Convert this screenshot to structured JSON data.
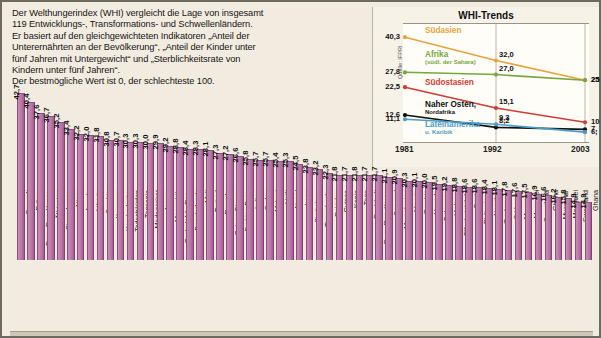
{
  "intro": {
    "line1": "Der Welthungerindex (WHI) vergleicht die Lage von insgesamt",
    "line2": "119 Entwicklungs-, Transformations- und Schwellenländern.",
    "line3": "Er basiert auf den gleichgewichteten Indikatoren „Anteil der",
    "line4": "Unterernährten an der Bevölkerung“, „Anteil der Kinder unter",
    "line5": "fünf Jahren mit Untergewicht“ und „Sterblichkeitsrate von",
    "line6": "Kindern unter fünf Jahren“.",
    "line7": "Der bestmögliche Wert ist 0, der schlechteste 100."
  },
  "trends": {
    "title": "WHI-Trends",
    "source": "Quelle: IFPRI",
    "x_ticks": [
      "1981",
      "1992",
      "2003"
    ],
    "series_labels": [
      {
        "name": "Südasien",
        "color": "#e8a33d",
        "sub": ""
      },
      {
        "name": "Afrika",
        "color": "#76a63f",
        "sub": "(südl. der Sahara)"
      },
      {
        "name": "Südostasien",
        "color": "#cf3b35",
        "sub": ""
      },
      {
        "name": "Naher Osten,",
        "color": "#111111",
        "sub": "Nordafrika"
      },
      {
        "name": "Lateinamerika",
        "color": "#4a9ec6",
        "sub": "u. Karibik"
      }
    ]
  },
  "chart_data": [
    {
      "type": "bar",
      "title": "Welthungerindex 2007 nach Ländern",
      "xlabel": "",
      "ylabel": "WHI-Wert",
      "ylim": [
        0,
        45
      ],
      "categories": [
        "Burundi",
        "Eritrea",
        "Dem. Rep. Kongo",
        "Äthiopien",
        "Sierra Leone",
        "Niger",
        "Angola",
        "Liberia",
        "Sambia",
        "Komoren",
        "Kambodscha",
        "Tadschikistan",
        "Tansania",
        "Madagaskar",
        "Jemen",
        "Mosambik",
        "Zentralafrik. Rep.",
        "Bangladesch",
        "Mali",
        "Tschad",
        "Ruanda",
        "Guinea-Bissau",
        "Burkina Faso",
        "Indien",
        "Sudan",
        "Malawi",
        "Haiti",
        "Nepal",
        "Laos",
        "Simbabwe",
        "Timor-Leste",
        "Pakistan",
        "Guinea",
        "Kenia",
        "Togo",
        "Dschibuti",
        "Dem. Rep. Korea",
        "Senegal",
        "Mauretanien",
        "Nigeria",
        "Gambia",
        "Uganda",
        "Botswana",
        "Vietnam",
        "Elfenbeinküste",
        "Benin",
        "Philippinen",
        "Namibia",
        "Guatemala",
        "Sri Lanka",
        "Myanmar",
        "Mongolei",
        "Swasiland",
        "Ghana"
      ],
      "values": [
        42.7,
        40.4,
        37.6,
        36.7,
        35.2,
        33.4,
        32.2,
        32.0,
        31.8,
        30.8,
        30.7,
        30.3,
        30.3,
        30.0,
        29.9,
        29.2,
        28.8,
        28.4,
        28.3,
        28.1,
        27.3,
        27.2,
        26.6,
        25.8,
        25.7,
        25.7,
        25.4,
        25.3,
        24.5,
        23.8,
        23.2,
        22.3,
        21.8,
        21.7,
        21.8,
        21.7,
        21.7,
        21.1,
        20.9,
        20.3,
        20.1,
        20.0,
        19.5,
        19.2,
        18.8,
        18.6,
        18.6,
        18.4,
        18.1,
        17.8,
        17.6,
        17.5,
        16.9,
        16.6
      ],
      "value_labels": [
        "42,7",
        "40,4",
        "37,6",
        "36,7",
        "35,2",
        "33,4",
        "32,2",
        "32,0",
        "31,8",
        "30,8",
        "30,7",
        "30,3",
        "30,3",
        "30,0",
        "29,9",
        "29,2",
        "28,8",
        "28,4",
        "28,3",
        "28,1",
        "27,3",
        "27,2",
        "26,6",
        "25,8",
        "25,7",
        "25,7",
        "25,4",
        "25,3",
        "24,5",
        "23,8",
        "23,2",
        "22,3",
        "21,8",
        "21,7",
        "21,8",
        "21,7",
        "21,7",
        "21,1",
        "20,9",
        "20,3",
        "20,1",
        "20,0",
        "19,5",
        "19,2",
        "18,8",
        "18,6",
        "18,6",
        "18,4",
        "18,1",
        "17,8",
        "17,6",
        "17,5",
        "16,9",
        "16,6"
      ],
      "extra_categories": [
        "Guatemala",
        "Sri Lanka",
        "Myanmar",
        "Mongolei",
        "Swasiland",
        "Ghana"
      ],
      "extra_values": [
        16.9,
        16.6,
        16.2,
        15.8,
        14.9,
        14.9
      ],
      "extra_value_labels": [
        "16,9",
        "16,6",
        "16,2",
        "15,8",
        "14,9",
        "14,9"
      ]
    },
    {
      "type": "line",
      "title": "WHI-Trends",
      "x": [
        "1981",
        "1992",
        "2003"
      ],
      "xlabel": "",
      "ylabel": "WHI",
      "ylim": [
        0,
        45
      ],
      "legend_position": "inline",
      "series": [
        {
          "name": "Südasien",
          "color": "#e8a33d",
          "values": [
            40.3,
            32.0,
            25.0
          ],
          "labels": [
            "40,3",
            "32,0",
            "25"
          ]
        },
        {
          "name": "Afrika (südl. der Sahara)",
          "color": "#76a63f",
          "values": [
            27.8,
            27.0,
            25.0
          ],
          "labels": [
            "27,8",
            "27,0",
            "25"
          ]
        },
        {
          "name": "Südostasien",
          "color": "#cf3b35",
          "values": [
            22.5,
            15.1,
            10.0
          ],
          "labels": [
            "22,5",
            "15,1",
            "10"
          ]
        },
        {
          "name": "Naher Osten, Nordafrika",
          "color": "#111111",
          "values": [
            12.6,
            8.2,
            7.5
          ],
          "labels": [
            "12,6",
            "8,2",
            "7,"
          ]
        },
        {
          "name": "Lateinamerika u. Karibik",
          "color": "#4a9ec6",
          "values": [
            11.1,
            9.3,
            6.5
          ],
          "labels": [
            "11,1",
            "9,3",
            "6,"
          ]
        }
      ]
    }
  ]
}
